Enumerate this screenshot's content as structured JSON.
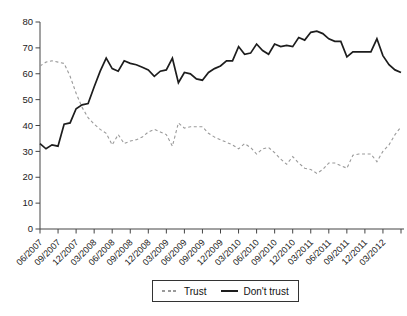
{
  "chart_data": {
    "type": "line",
    "title": "",
    "xlabel": "",
    "ylabel": "",
    "x_start": "06/2007",
    "x_end": "06/2012",
    "frequency": "monthly",
    "n_points": 61,
    "ylim": [
      0,
      80
    ],
    "y_ticks": [
      0,
      10,
      20,
      30,
      40,
      50,
      60,
      70,
      80
    ],
    "x_tick_labels": [
      "06/2007",
      "09/2007",
      "12/2007",
      "03/2008",
      "06/2008",
      "09/2008",
      "12/2008",
      "03/2009",
      "06/2009",
      "09/2009",
      "12/2009",
      "03/2010",
      "06/2010",
      "09/2010",
      "12/2010",
      "03/2011",
      "06/2011",
      "09/2011",
      "12/2011",
      "03/2012"
    ],
    "x_tick_months": [
      0,
      3,
      6,
      9,
      12,
      15,
      18,
      21,
      24,
      27,
      30,
      33,
      36,
      39,
      42,
      45,
      48,
      51,
      54,
      57
    ],
    "extra_end_tick_month": 60,
    "grid": "off",
    "legend_position": "bottom-center",
    "series": [
      {
        "name": "Trust",
        "style": "dashed",
        "color": "#9a9a9a",
        "values": [
          63,
          64.5,
          65,
          64.5,
          64,
          59,
          52.5,
          47,
          43,
          40.5,
          38.5,
          37,
          32.5,
          36.5,
          33,
          34,
          34.5,
          35.5,
          37.5,
          38.5,
          37.5,
          36.5,
          32,
          41,
          39,
          39.5,
          39.5,
          39.5,
          37,
          35.5,
          34.5,
          33.5,
          32.5,
          31,
          33,
          31.5,
          29,
          31,
          31.5,
          29.5,
          27,
          25,
          28,
          25.5,
          23.5,
          23,
          21.5,
          23,
          25.5,
          25.5,
          24.5,
          23.5,
          28.5,
          29,
          29,
          29,
          26,
          30,
          32.5,
          36.5,
          39.5
        ]
      },
      {
        "name": "Don't trust",
        "style": "solid",
        "color": "#1d1d1d",
        "values": [
          33,
          31,
          32.5,
          32,
          40.5,
          41,
          46.5,
          48,
          48.5,
          55,
          61,
          66,
          62,
          61,
          65,
          64,
          63.5,
          62.5,
          61.5,
          59,
          61,
          61.5,
          66,
          56.5,
          60.5,
          60,
          58,
          57.5,
          60.5,
          62,
          63,
          65,
          65,
          70.5,
          67.5,
          68,
          71.5,
          69,
          67.5,
          71.5,
          70.5,
          71,
          70.5,
          74,
          73,
          76,
          76.5,
          75.5,
          73.5,
          72.5,
          72.5,
          66.5,
          68.5,
          68.5,
          68.5,
          68.5,
          73.5,
          67,
          63.5,
          61.5,
          60.5
        ]
      }
    ]
  },
  "legend": {
    "trust_label": "Trust",
    "dont_trust_label": "Don't trust"
  },
  "axis": {
    "color": "#444444",
    "tick_label_color": "#222222"
  }
}
